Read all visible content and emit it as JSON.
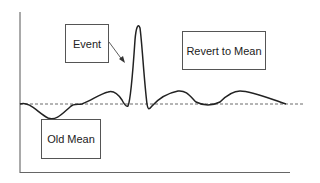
{
  "diagram": {
    "labels": {
      "event": "Event",
      "revert": "Revert to Mean",
      "old_mean": "Old Mean"
    },
    "colors": {
      "line": "#222222",
      "axis": "#555555",
      "mean": "#444444"
    }
  }
}
